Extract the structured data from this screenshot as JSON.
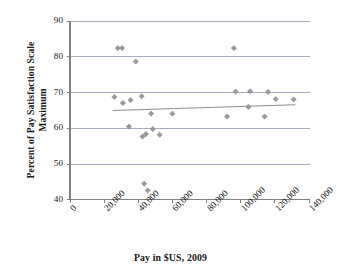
{
  "chart_data": {
    "type": "scatter",
    "title": "",
    "xlabel": "Pay in $US, 2009",
    "ylabel": "Percent of Pay Satisfaction Scale Maximum",
    "xlim": [
      0,
      140000
    ],
    "ylim": [
      40,
      90
    ],
    "grid": "horizontal",
    "legend": "none",
    "xticks": [
      0,
      20000,
      40000,
      60000,
      80000,
      100000,
      120000,
      140000
    ],
    "xtick_labels": [
      "0",
      "20,000",
      "40,000",
      "60,000",
      "80,000",
      "100,000",
      "120,000",
      "140,000"
    ],
    "yticks": [
      40,
      50,
      60,
      70,
      80,
      90
    ],
    "ytick_labels": [
      "40",
      "50",
      "60",
      "70",
      "80",
      "90"
    ],
    "marker_shape": "diamond",
    "marker_color": "#9a9a9a",
    "marker_edge_color": "#8a8a8a",
    "points": [
      {
        "x": 26000,
        "y": 68.8
      },
      {
        "x": 28000,
        "y": 82.5
      },
      {
        "x": 30500,
        "y": 82.5
      },
      {
        "x": 31000,
        "y": 67.1
      },
      {
        "x": 34500,
        "y": 60.5
      },
      {
        "x": 35500,
        "y": 67.9
      },
      {
        "x": 38500,
        "y": 78.7
      },
      {
        "x": 42000,
        "y": 69.0
      },
      {
        "x": 42500,
        "y": 57.7
      },
      {
        "x": 43500,
        "y": 44.5
      },
      {
        "x": 44500,
        "y": 58.4
      },
      {
        "x": 45500,
        "y": 42.6
      },
      {
        "x": 47500,
        "y": 64.1
      },
      {
        "x": 48500,
        "y": 59.8
      },
      {
        "x": 52500,
        "y": 58.2
      },
      {
        "x": 60000,
        "y": 64.1
      },
      {
        "x": 92000,
        "y": 63.3
      },
      {
        "x": 96000,
        "y": 82.5
      },
      {
        "x": 97000,
        "y": 70.3
      },
      {
        "x": 104500,
        "y": 66.0
      },
      {
        "x": 105500,
        "y": 70.4
      },
      {
        "x": 114000,
        "y": 63.3
      },
      {
        "x": 116000,
        "y": 70.2
      },
      {
        "x": 120500,
        "y": 68.2
      },
      {
        "x": 131000,
        "y": 68.1
      }
    ],
    "trendline": {
      "color": "#8f8f8f",
      "x_start": 25000,
      "y_start": 65.0,
      "x_end": 132000,
      "y_end": 66.6
    }
  },
  "axes": {
    "axis_color": "#808080",
    "grid_color": "#9aa7b8"
  }
}
